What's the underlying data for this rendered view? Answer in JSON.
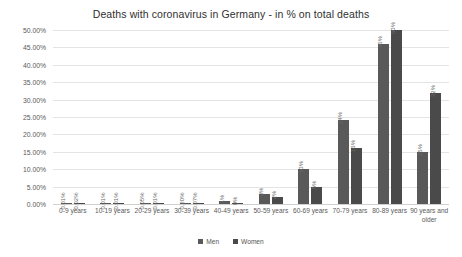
{
  "chart_data": {
    "type": "bar",
    "title": "Deaths with coronavirus in Germany - in % on total deaths",
    "xlabel": "",
    "ylabel": "",
    "ylim": [
      0,
      50
    ],
    "grid": true,
    "legend_position": "bottom",
    "categories": [
      "0-9 years",
      "10-19 years",
      "20-29 years",
      "30-39 years",
      "40-49 years",
      "50-59 years",
      "60-69 years",
      "70-79 years",
      "80-89 years",
      "90 years and older"
    ],
    "ytick_labels": [
      "0.00%",
      "5.00%",
      "10.00%",
      "15.00%",
      "20.00%",
      "25.00%",
      "30.00%",
      "35.00%",
      "40.00%",
      "45.00%",
      "50.00%"
    ],
    "ytick_values": [
      0,
      5,
      10,
      15,
      20,
      25,
      30,
      35,
      40,
      45,
      50
    ],
    "series": [
      {
        "name": "Men",
        "color": "#595959",
        "values": [
          0.01,
          0.01,
          0.05,
          0.2,
          1,
          3,
          10,
          24,
          46,
          15
        ],
        "labels": [
          "0.01%",
          "0.01%",
          "0.05%",
          "0.20%",
          "1%",
          "3%",
          "10%",
          "24%",
          "46%",
          "15%"
        ]
      },
      {
        "name": "Women",
        "color": "#4a4a4a",
        "values": [
          0.02,
          0.01,
          0.01,
          0.07,
          0,
          2,
          5,
          16,
          50,
          32
        ],
        "labels": [
          "0.02%",
          "0.01%",
          "0.01%",
          "0.07%",
          "0%",
          "2%",
          "5%",
          "16%",
          "50%",
          "32%"
        ]
      }
    ]
  },
  "legend": {
    "items": [
      {
        "label": "Men"
      },
      {
        "label": "Women"
      }
    ]
  }
}
